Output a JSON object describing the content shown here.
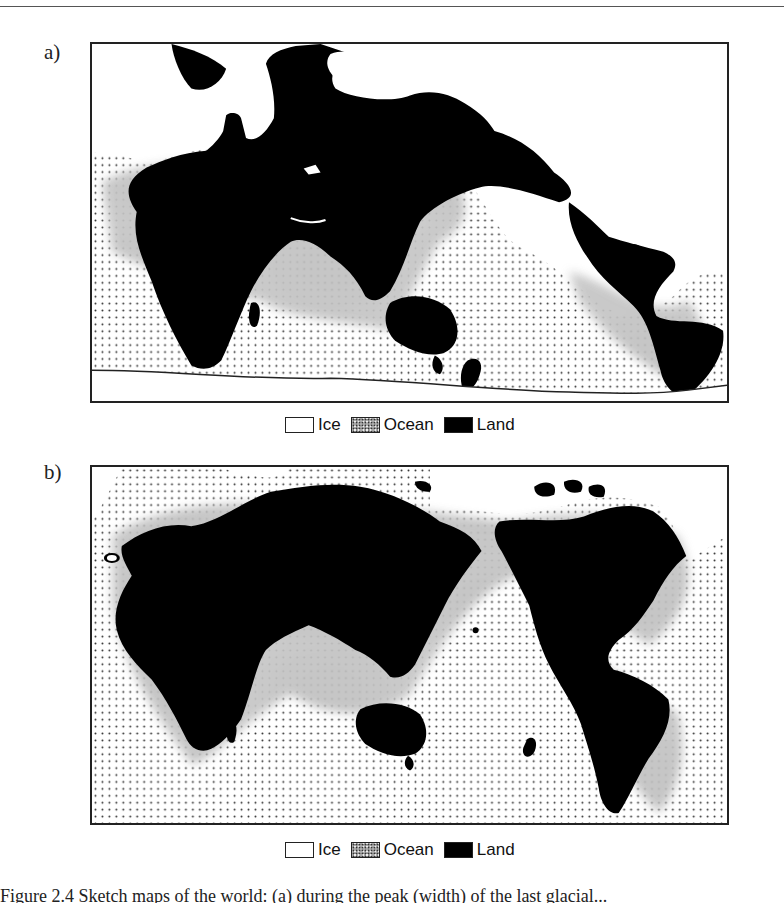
{
  "figure": {
    "panels": [
      {
        "label": "a)",
        "legend": [
          {
            "key": "ice",
            "label": "Ice",
            "color": "#ffffff"
          },
          {
            "key": "ocean",
            "label": "Ocean",
            "color": "#9a9a9a"
          },
          {
            "key": "land",
            "label": "Land",
            "color": "#000000"
          }
        ]
      },
      {
        "label": "b)",
        "legend": [
          {
            "key": "ice",
            "label": "Ice",
            "color": "#ffffff"
          },
          {
            "key": "ocean",
            "label": "Ocean",
            "color": "#9a9a9a"
          },
          {
            "key": "land",
            "label": "Land",
            "color": "#000000"
          }
        ]
      }
    ],
    "caption": "Figure 2.4 Sketch maps of the world: (a) during the peak (width) of the last glacial..."
  }
}
